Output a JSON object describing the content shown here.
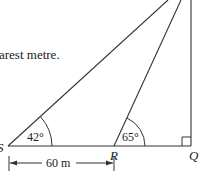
{
  "question_fragment": "arest metre.",
  "points": {
    "S": {
      "label": "S"
    },
    "R": {
      "label": "R"
    },
    "Q": {
      "label": "Q"
    }
  },
  "angles": {
    "at_S": "42°",
    "at_R": "65°",
    "at_Q": "right angle"
  },
  "dimension": {
    "label": "60 m",
    "from": "S",
    "to": "R"
  },
  "colors": {
    "line": "#333333",
    "background": "#ffffff"
  }
}
